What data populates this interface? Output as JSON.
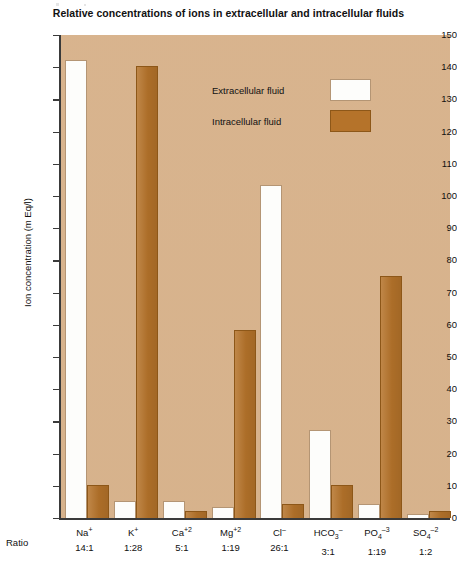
{
  "chart_data": {
    "type": "bar",
    "title": "Relative concentrations of ions in extracellular and intracellular fluids",
    "xlabel": "",
    "ylabel": "Ion concentration (m Eq/l)",
    "ylim": [
      0,
      150
    ],
    "ytick_step": 10,
    "yticks": [
      0,
      10,
      20,
      30,
      40,
      50,
      60,
      70,
      80,
      90,
      100,
      110,
      120,
      130,
      140,
      150
    ],
    "grid": false,
    "legend_position": "upper-center",
    "categories": [
      "Na+",
      "K+",
      "Ca+2",
      "Mg+2",
      "Cl-",
      "HCO3-",
      "PO4-3",
      "SO4-2"
    ],
    "category_html": [
      {
        "base": "Na",
        "sup": "+",
        "sub": ""
      },
      {
        "base": "K",
        "sup": "+",
        "sub": ""
      },
      {
        "base": "Ca",
        "sup": "+2",
        "sub": ""
      },
      {
        "base": "Mg",
        "sup": "+2",
        "sub": ""
      },
      {
        "base": "Cl",
        "sup": "–",
        "sub": ""
      },
      {
        "base": "HCO",
        "sup": "–",
        "sub": "3"
      },
      {
        "base": "PO",
        "sup": "–3",
        "sub": "4"
      },
      {
        "base": "SO",
        "sup": "–2",
        "sub": "4"
      }
    ],
    "ratios": [
      "14:1",
      "1:28",
      "5:1",
      "1:19",
      "26:1",
      "3:1",
      "1:19",
      "1:2"
    ],
    "ratio_row_label": "Ratio",
    "series": [
      {
        "name": "Extracellular fluid",
        "color": "#fdfdfb",
        "values": [
          142,
          5,
          5,
          3,
          103,
          27,
          4,
          1
        ]
      },
      {
        "name": "Intracellular fluid",
        "color": "#b5732a",
        "values": [
          10,
          140,
          2,
          58,
          4,
          10,
          75,
          2
        ]
      }
    ]
  },
  "legend": {
    "items": [
      {
        "label": "Extracellular fluid",
        "swatch": "white"
      },
      {
        "label": "Intracellular fluid",
        "swatch": "brown"
      }
    ]
  },
  "colors": {
    "plot_background": "#dbb68f",
    "extracellular": "#fdfdfb",
    "intracellular": "#b5732a",
    "axis": "#3a3a3a",
    "text": "#111111"
  }
}
